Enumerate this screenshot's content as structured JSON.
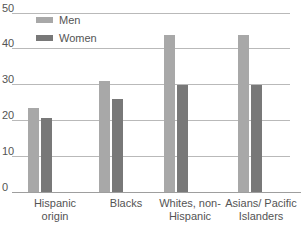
{
  "chart_data": {
    "type": "bar",
    "title": "",
    "xlabel": "",
    "ylabel": "",
    "ylim": [
      0,
      50
    ],
    "yticks": [
      50,
      40,
      30,
      20,
      10,
      0
    ],
    "grid": true,
    "legend_position": "top-left",
    "categories": [
      "Hispanic origin",
      "Blacks",
      "Whites, non-Hispanic",
      "Asians/ Pacific Islanders"
    ],
    "category_lines": [
      [
        "Hispanic",
        "origin"
      ],
      [
        "Blacks"
      ],
      [
        "Whites, non-",
        "Hispanic"
      ],
      [
        "Asians/ Pacific",
        "Islanders"
      ]
    ],
    "series": [
      {
        "name": "Men",
        "color": "#a8a8a8",
        "values": [
          23.5,
          31.0,
          44.0,
          44.0
        ]
      },
      {
        "name": "Women",
        "color": "#787878",
        "values": [
          20.7,
          26.0,
          30.0,
          30.0
        ]
      }
    ]
  },
  "legend": {
    "items": [
      {
        "label": "Men",
        "color": "#a8a8a8"
      },
      {
        "label": "Women",
        "color": "#787878"
      }
    ]
  },
  "axis": {
    "y_tick_labels": [
      "50",
      "40",
      "30",
      "20",
      "10",
      "0"
    ]
  }
}
